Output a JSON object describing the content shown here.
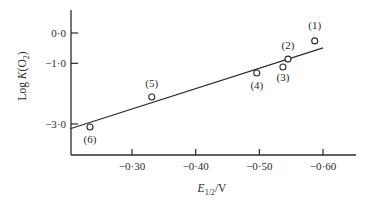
{
  "chart_data": {
    "type": "scatter",
    "title": "",
    "xlabel": "E1/2/V",
    "ylabel": "Log K(O2)",
    "xlim": [
      -0.18,
      -0.65
    ],
    "ylim": [
      -4.0,
      0.75
    ],
    "x_ticks": [
      {
        "value": -0.3,
        "label": "−0·30"
      },
      {
        "value": -0.4,
        "label": "−0·40"
      },
      {
        "value": -0.5,
        "label": "−0·50"
      },
      {
        "value": -0.6,
        "label": "−0·60"
      }
    ],
    "y_ticks": [
      {
        "value": 0.0,
        "label": "0·0"
      },
      {
        "value": -1.0,
        "label": "−1·0"
      },
      {
        "value": -3.0,
        "label": "−3·0"
      }
    ],
    "grid": false,
    "legend": null,
    "series": [
      {
        "name": "complexes",
        "marker": "open-circle",
        "points": [
          {
            "label": "(1)",
            "x": -0.587,
            "y": -0.26
          },
          {
            "label": "(2)",
            "x": -0.545,
            "y": -0.86
          },
          {
            "label": "(3)",
            "x": -0.537,
            "y": -1.12
          },
          {
            "label": "(4)",
            "x": -0.496,
            "y": -1.32
          },
          {
            "label": "(5)",
            "x": -0.331,
            "y": -2.11
          },
          {
            "label": "(6)",
            "x": -0.234,
            "y": -3.1
          }
        ]
      }
    ],
    "fit_line": {
      "x": [
        -0.203,
        -0.6
      ],
      "y": [
        -3.16,
        -0.49
      ]
    }
  },
  "labels": {
    "y_axis": {
      "main": "Log ",
      "k": "K",
      "paren_open": "(O",
      "sub": "2",
      "paren_close": ")"
    },
    "x_axis": {
      "e": "E",
      "sub": "1/2",
      "unit": "/V"
    }
  }
}
